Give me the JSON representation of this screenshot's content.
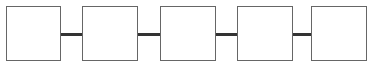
{
  "diagram": {
    "type": "chain",
    "node_count": 5,
    "nodes": [
      {
        "id": "node-1",
        "label": ""
      },
      {
        "id": "node-2",
        "label": ""
      },
      {
        "id": "node-3",
        "label": ""
      },
      {
        "id": "node-4",
        "label": ""
      },
      {
        "id": "node-5",
        "label": ""
      }
    ],
    "edges": [
      {
        "from": "node-1",
        "to": "node-2"
      },
      {
        "from": "node-2",
        "to": "node-3"
      },
      {
        "from": "node-3",
        "to": "node-4"
      },
      {
        "from": "node-4",
        "to": "node-5"
      }
    ],
    "colors": {
      "border": "#666666",
      "connector": "#333333",
      "fill": "#ffffff"
    }
  }
}
